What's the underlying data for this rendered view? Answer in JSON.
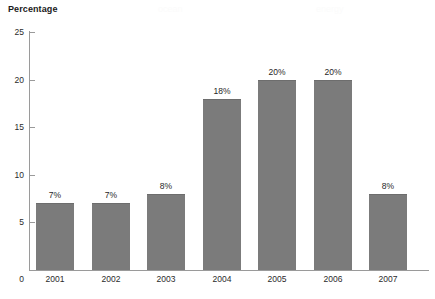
{
  "chart_data": {
    "type": "bar",
    "title": "",
    "ylabel": "Percentage",
    "xlabel": "",
    "categories": [
      "2001",
      "2002",
      "2003",
      "2004",
      "2005",
      "2006",
      "2007"
    ],
    "values": [
      7,
      7,
      8,
      18,
      20,
      20,
      8
    ],
    "data_labels": [
      "7%",
      "7%",
      "8%",
      "18%",
      "20%",
      "20%",
      "8%"
    ],
    "ylim": [
      0,
      25
    ],
    "yticks": [
      0,
      5,
      10,
      15,
      20,
      25
    ],
    "ytick_labels": [
      "0",
      "5",
      "10",
      "15",
      "20",
      "25"
    ],
    "grid": false,
    "legend": null,
    "bar_color": "#7b7b7b",
    "axis_color": "#9a9a9a",
    "text_color": "#1f1f1f"
  },
  "watermarks": [
    {
      "text": "ocean",
      "left": 158,
      "top": 4
    },
    {
      "text": "energy",
      "left": 316,
      "top": 4
    }
  ]
}
